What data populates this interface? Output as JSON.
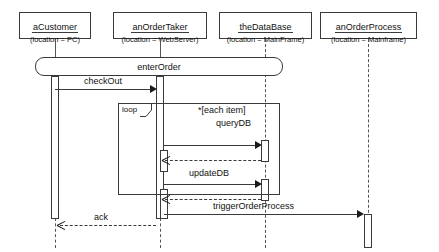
{
  "diagram": {
    "type": "uml-sequence-diagram",
    "title": "",
    "lifelines": [
      {
        "name": "aCustomer",
        "location_label": "(location = PC)",
        "x": 55,
        "kind": "actor-object"
      },
      {
        "name": "anOrderTaker",
        "location_label": "(location = WebServer)",
        "x": 160,
        "kind": "object"
      },
      {
        "name": "theDataBase",
        "location_label": "(location = MainFrame)",
        "x": 265,
        "kind": "object"
      },
      {
        "name": "anOrderProcess",
        "location_label": "(location = Mainframe)",
        "x": 368,
        "kind": "object"
      }
    ],
    "messages": [
      {
        "label": "enterOrder",
        "style": "rounded-box",
        "from": "aCustomer",
        "to": "anOrderTaker"
      },
      {
        "label": "checkOut",
        "style": "solid",
        "from": "aCustomer",
        "to": "anOrderTaker"
      },
      {
        "label": "queryDB",
        "style": "solid",
        "from": "anOrderTaker",
        "to": "theDataBase"
      },
      {
        "label": "updateDB",
        "style": "solid",
        "from": "anOrderTaker",
        "to": "theDataBase"
      },
      {
        "label": "triggerOrderProcess",
        "style": "solid",
        "from": "anOrderTaker",
        "to": "anOrderProcess"
      },
      {
        "label": "ack",
        "style": "dashed",
        "from": "anOrderTaker",
        "to": "aCustomer"
      }
    ],
    "fragment": {
      "operator": "loop",
      "guard": "*[each item]"
    }
  }
}
